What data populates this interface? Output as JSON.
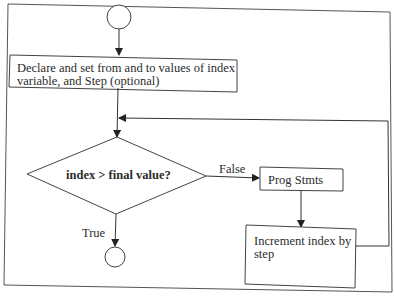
{
  "diagram": {
    "type": "flowchart",
    "nodes": [
      {
        "id": "start",
        "shape": "circle",
        "label": ""
      },
      {
        "id": "init",
        "shape": "rectangle",
        "label_line1": "Declare and set from and to values of index",
        "label_line2": "variable, and Step (optional)"
      },
      {
        "id": "cond",
        "shape": "diamond",
        "label": "index > final value?"
      },
      {
        "id": "body",
        "shape": "rectangle",
        "label": "Prog Stmts"
      },
      {
        "id": "incr",
        "shape": "rectangle",
        "label_line1": "Increment index by",
        "label_line2": "step"
      },
      {
        "id": "end",
        "shape": "circle",
        "label": ""
      }
    ],
    "edges": [
      {
        "from": "start",
        "to": "init",
        "label": ""
      },
      {
        "from": "init",
        "to": "cond",
        "label": ""
      },
      {
        "from": "cond",
        "to": "body",
        "label": "False"
      },
      {
        "from": "body",
        "to": "incr",
        "label": ""
      },
      {
        "from": "incr",
        "to": "cond",
        "label": ""
      },
      {
        "from": "cond",
        "to": "end",
        "label": "True"
      }
    ],
    "edge_labels": {
      "false": "False",
      "true": "True"
    }
  }
}
